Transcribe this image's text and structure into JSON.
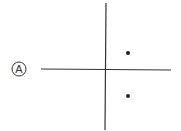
{
  "diagram": {
    "label": "A",
    "axes": {
      "horizontal": {
        "x1": 41,
        "y1": 69,
        "x2": 171,
        "y2": 70
      },
      "vertical": {
        "x1": 106,
        "y1": 3,
        "x2": 105,
        "y2": 130
      }
    },
    "points": [
      {
        "x": 128,
        "y": 53
      },
      {
        "x": 128,
        "y": 96
      }
    ],
    "colors": {
      "line": "#333333",
      "point": "#222222",
      "background": "#ffffff"
    }
  }
}
